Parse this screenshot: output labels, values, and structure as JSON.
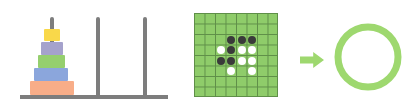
{
  "colors": {
    "pole": "#7d7d7d",
    "grid_bg": "#8fcc6a",
    "grid_line": "#5f8f48",
    "black_stone": "#3a3a3a",
    "white_stone": "#ffffff",
    "accent_green": "#9ed86f"
  },
  "hanoi": {
    "poles": [
      {
        "x": 50,
        "top": 17
      },
      {
        "x": 96,
        "top": 17
      },
      {
        "x": 143,
        "top": 17
      }
    ],
    "base": {
      "left": 20,
      "right": 168,
      "y": 95
    },
    "disks": [
      {
        "name": "yellow",
        "color": "#f9d84a",
        "left": 44,
        "top": 29,
        "width": 16,
        "height": 12
      },
      {
        "name": "purple",
        "color": "#a5a2cc",
        "left": 41,
        "top": 42,
        "width": 22,
        "height": 13
      },
      {
        "name": "green",
        "color": "#95cf6e",
        "left": 38,
        "top": 55,
        "width": 27,
        "height": 13
      },
      {
        "name": "blue",
        "color": "#8ba6dc",
        "left": 34,
        "top": 68,
        "width": 34,
        "height": 13
      },
      {
        "name": "orange",
        "color": "#f8ad88",
        "left": 30,
        "top": 81,
        "width": 44,
        "height": 14
      }
    ]
  },
  "board": {
    "left": 194,
    "top": 13,
    "size": 84,
    "cells": 8,
    "stones": [
      {
        "row": 2,
        "col": 3,
        "color": "black"
      },
      {
        "row": 2,
        "col": 4,
        "color": "black"
      },
      {
        "row": 2,
        "col": 5,
        "color": "black"
      },
      {
        "row": 3,
        "col": 2,
        "color": "white"
      },
      {
        "row": 3,
        "col": 3,
        "color": "black"
      },
      {
        "row": 3,
        "col": 4,
        "color": "white"
      },
      {
        "row": 3,
        "col": 5,
        "color": "white"
      },
      {
        "row": 4,
        "col": 2,
        "color": "black"
      },
      {
        "row": 4,
        "col": 3,
        "color": "black"
      },
      {
        "row": 4,
        "col": 4,
        "color": "white"
      },
      {
        "row": 4,
        "col": 5,
        "color": "white"
      },
      {
        "row": 5,
        "col": 3,
        "color": "white"
      },
      {
        "row": 5,
        "col": 5,
        "color": "white"
      }
    ]
  },
  "arrow": {
    "left": 300,
    "top": 52,
    "width": 24,
    "height": 16
  },
  "circle": {
    "cx": 368,
    "cy": 57,
    "r": 30,
    "stroke": 7
  }
}
